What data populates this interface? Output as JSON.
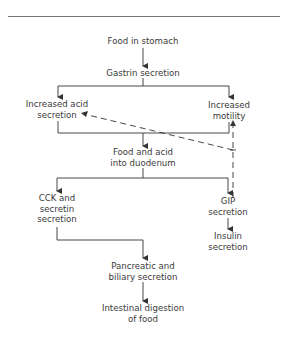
{
  "diagram": {
    "type": "flowchart",
    "nodes": {
      "food_in_stomach": "Food in stomach",
      "gastrin_secretion": "Gastrin secretion",
      "increased_acid": {
        "line1": "Increased acid",
        "line2": "secretion"
      },
      "increased_motility": {
        "line1": "Increased",
        "line2": "motility"
      },
      "food_acid_duodenum": {
        "line1": "Food and acid",
        "line2": "into duodenum"
      },
      "cck_secretin": {
        "line1": "CCK and",
        "line2": "secretin",
        "line3": "secretion"
      },
      "gip_secretion": {
        "line1": "GIP",
        "line2": "secretion"
      },
      "insulin_secretion": {
        "line1": "Insulin",
        "line2": "secretion"
      },
      "pancreatic_biliary": {
        "line1": "Pancreatic and",
        "line2": "biliary secretion"
      },
      "intestinal_digestion": {
        "line1": "Intestinal digestion",
        "line2": "of food"
      }
    },
    "edges": [
      {
        "from": "Food in stomach",
        "to": "Gastrin secretion",
        "style": "solid"
      },
      {
        "from": "Gastrin secretion",
        "to": "Increased acid secretion",
        "style": "solid"
      },
      {
        "from": "Gastrin secretion",
        "to": "Increased motility",
        "style": "solid"
      },
      {
        "from": "Increased acid secretion + Increased motility",
        "to": "Food and acid into duodenum",
        "style": "solid"
      },
      {
        "from": "Food and acid into duodenum",
        "to": "CCK and secretin secretion",
        "style": "solid"
      },
      {
        "from": "Food and acid into duodenum",
        "to": "GIP secretion",
        "style": "solid"
      },
      {
        "from": "GIP secretion",
        "to": "Insulin secretion",
        "style": "solid"
      },
      {
        "from": "CCK and secretin secretion",
        "to": "Pancreatic and biliary secretion",
        "style": "solid"
      },
      {
        "from": "Pancreatic and biliary secretion",
        "to": "Intestinal digestion of food",
        "style": "solid"
      },
      {
        "from": "GIP secretion",
        "to": "Increased acid secretion",
        "style": "dashed",
        "meaning": "inhibition"
      },
      {
        "from": "GIP secretion",
        "to": "Increased motility",
        "style": "dashed",
        "meaning": "inhibition"
      }
    ],
    "colors": {
      "line": "#333333",
      "text": "#3a3a3a",
      "rule": "#777777"
    }
  }
}
